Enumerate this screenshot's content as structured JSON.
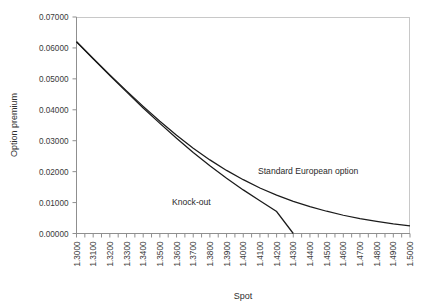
{
  "chart_data": {
    "type": "line",
    "title": "",
    "xlabel": "Spot",
    "ylabel": "Option premium",
    "xlim": [
      1.3,
      1.5
    ],
    "ylim": [
      0.0,
      0.07
    ],
    "grid": false,
    "legend_position": "inline-annotations",
    "x_tick_labels": [
      "1.3000",
      "1.3100",
      "1.3200",
      "1.3300",
      "1.3400",
      "1.3500",
      "1.3600",
      "1.3700",
      "1.3800",
      "1.3900",
      "1.4000",
      "1.4100",
      "1.4200",
      "1.4300",
      "1.4400",
      "1.4500",
      "1.4600",
      "1.4700",
      "1.4800",
      "1.4900",
      "1.5000"
    ],
    "y_tick_labels": [
      "0.00000",
      "0.01000",
      "0.02000",
      "0.03000",
      "0.04000",
      "0.05000",
      "0.06000",
      "0.07000"
    ],
    "x": [
      1.3,
      1.31,
      1.32,
      1.33,
      1.34,
      1.35,
      1.36,
      1.37,
      1.38,
      1.39,
      1.4,
      1.41,
      1.42,
      1.43,
      1.44,
      1.45,
      1.46,
      1.47,
      1.48,
      1.49,
      1.5
    ],
    "series": [
      {
        "name": "Standard European option",
        "color": "#1b1b1b",
        "values": [
          0.062,
          0.0566,
          0.0513,
          0.0461,
          0.0411,
          0.0363,
          0.0318,
          0.0276,
          0.0238,
          0.0204,
          0.0174,
          0.0147,
          0.0124,
          0.0104,
          0.0087,
          0.0072,
          0.0059,
          0.0048,
          0.0039,
          0.0031,
          0.0025
        ]
      },
      {
        "name": "Knock-out",
        "color": "#1b1b1b",
        "values": [
          0.062,
          0.0565,
          0.0511,
          0.0458,
          0.0406,
          0.0356,
          0.0308,
          0.0262,
          0.0219,
          0.0179,
          0.0141,
          0.0106,
          0.0071,
          0.0,
          null,
          null,
          null,
          null,
          null,
          null,
          null
        ]
      }
    ],
    "annotations": [
      {
        "label": "Standard European option",
        "x_px": 258,
        "y_px": 174
      },
      {
        "label": "Knock-out",
        "x_px": 172,
        "y_px": 205
      }
    ]
  }
}
